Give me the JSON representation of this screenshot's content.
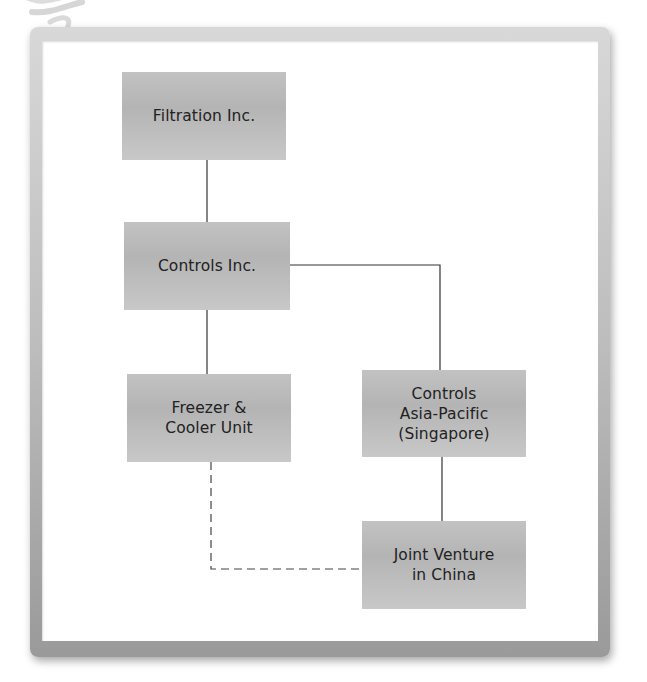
{
  "diagram": {
    "type": "organizational-chart",
    "nodes": [
      {
        "id": "filtration",
        "label": "Filtration Inc."
      },
      {
        "id": "controls",
        "label": "Controls Inc."
      },
      {
        "id": "freezer",
        "label": "Freezer &\nCooler Unit"
      },
      {
        "id": "asia_pacific",
        "label": "Controls\nAsia-Pacific\n(Singapore)"
      },
      {
        "id": "joint_venture",
        "label": "Joint Venture\nin China"
      }
    ],
    "edges": [
      {
        "from": "filtration",
        "to": "controls",
        "style": "solid"
      },
      {
        "from": "controls",
        "to": "freezer",
        "style": "solid"
      },
      {
        "from": "controls",
        "to": "asia_pacific",
        "style": "solid"
      },
      {
        "from": "asia_pacific",
        "to": "joint_venture",
        "style": "solid"
      },
      {
        "from": "freezer",
        "to": "joint_venture",
        "style": "dashed"
      }
    ],
    "colors": {
      "node_fill": "#bdbdbd",
      "node_text": "#222222",
      "connector": "#333333",
      "frame": "#b5b5b5"
    }
  }
}
